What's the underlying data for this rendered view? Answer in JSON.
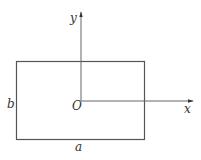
{
  "diagram": {
    "type": "coordinate-axes-with-rectangle",
    "axes": {
      "x_label": "x",
      "y_label": "y",
      "origin_label": "O"
    },
    "rectangle": {
      "width_label": "a",
      "height_label": "b"
    },
    "colors": {
      "stroke": "#555555",
      "text": "#333333",
      "background": "#ffffff"
    }
  }
}
